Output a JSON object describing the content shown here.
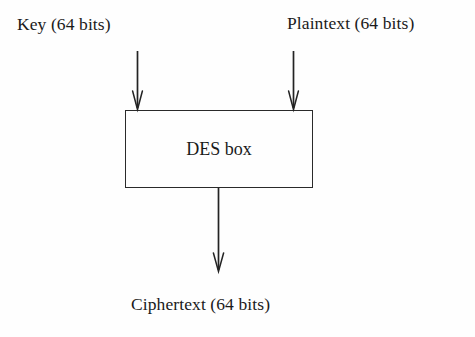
{
  "figure": {
    "background_color": "#fefefe",
    "ink_color": "#232323"
  },
  "labels": {
    "key": "Key (64 bits)",
    "plaintext": "Plaintext (64 bits)",
    "ciphertext": "Ciphertext (64 bits)"
  },
  "block": {
    "name": "DES box",
    "border_color": "#2a2a2a"
  },
  "arrows": [
    {
      "name": "key-input-arrow",
      "from": "Key (64 bits)",
      "to": "DES box",
      "direction": "down"
    },
    {
      "name": "plaintext-input-arrow",
      "from": "Plaintext (64 bits)",
      "to": "DES box",
      "direction": "down"
    },
    {
      "name": "ciphertext-output-arrow",
      "from": "DES box",
      "to": "Ciphertext (64 bits)",
      "direction": "down"
    }
  ]
}
